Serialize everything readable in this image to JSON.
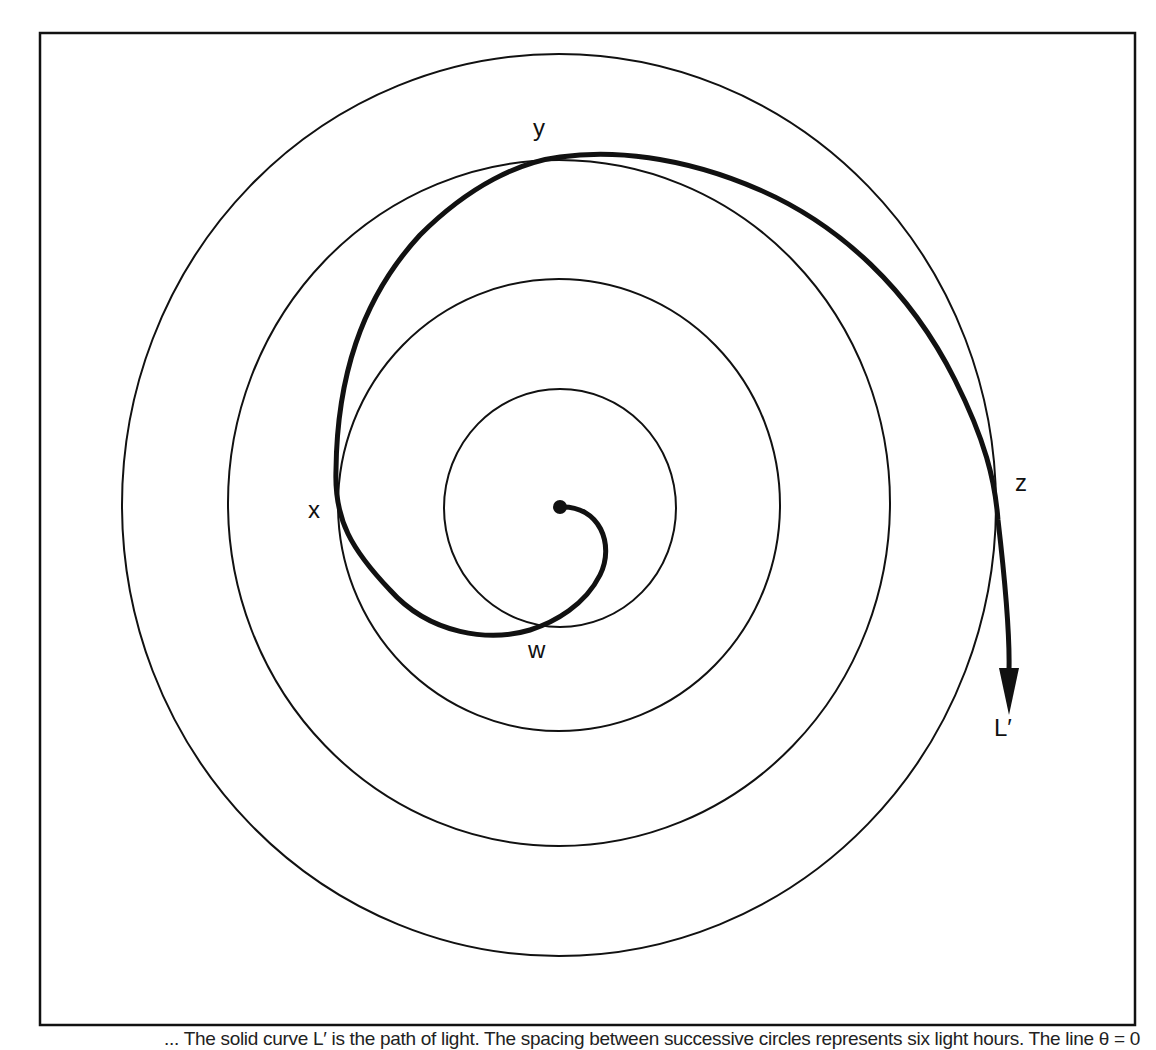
{
  "figure": {
    "frame": {
      "x": 40,
      "y": 33,
      "width": 1095,
      "height": 992,
      "stroke": "#111111"
    },
    "center": {
      "x": 560,
      "y": 507
    },
    "circles": [
      {
        "name": "circle-1",
        "cx": 560,
        "cy": 508,
        "rx": 116,
        "ry": 119
      },
      {
        "name": "circle-2",
        "cx": 559,
        "cy": 505,
        "rx": 221,
        "ry": 226
      },
      {
        "name": "circle-3",
        "cx": 559,
        "cy": 503,
        "rx": 331,
        "ry": 343
      },
      {
        "name": "circle-4",
        "cx": 559,
        "cy": 505,
        "rx": 437,
        "ry": 451
      }
    ],
    "spiral_path": "M 560 507 C 600 505, 615 545, 600 575 C 585 605, 555 622, 530 630 C 490 642, 430 635, 390 590 C 352 550, 334 520, 336 470 C 337 380, 360 300, 420 235 C 470 185, 520 162, 560 157 C 610 150, 680 155, 760 190 C 840 225, 910 290, 955 380 C 985 440, 995 480, 998 520 C 1005 580, 1010 630, 1009 670",
    "arrow": {
      "tip_x": 1009,
      "tip_y": 715,
      "base_y": 668,
      "half_width": 10
    },
    "labels": [
      {
        "id": "w",
        "text": "w",
        "x": 528,
        "y": 650
      },
      {
        "id": "x",
        "text": "x",
        "x": 308,
        "y": 510
      },
      {
        "id": "y",
        "text": "y",
        "x": 533,
        "y": 128
      },
      {
        "id": "z",
        "text": "z",
        "x": 1015,
        "y": 483
      },
      {
        "id": "L",
        "text": "L′",
        "x": 994,
        "y": 728
      }
    ],
    "colors": {
      "line": "#111111",
      "background": "#ffffff"
    }
  },
  "caption": {
    "text": "... The solid curve L′ is the path of light. The spacing between successive circles represents six light hours. The line θ = 0"
  }
}
